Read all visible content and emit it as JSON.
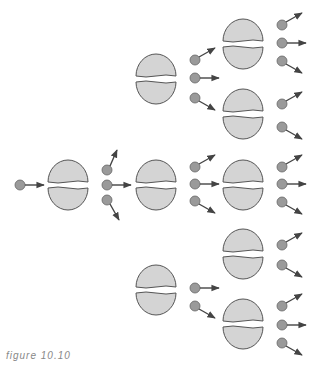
{
  "figure": {
    "caption": "figure 10.10"
  },
  "colors": {
    "nucleus_fill": "#d4d4d4",
    "nucleus_stroke": "#555555",
    "neutron_fill": "#9a9a9a",
    "arrow": "#444444"
  },
  "stages": [
    {
      "name": "incident-neutron",
      "count": 1
    },
    {
      "name": "generation-1",
      "nuclei": 1,
      "neutrons_released": 3
    },
    {
      "name": "generation-2",
      "nuclei": 3,
      "neutrons_released": 8
    },
    {
      "name": "generation-3",
      "nuclei": 5,
      "neutrons_released": 14
    }
  ]
}
